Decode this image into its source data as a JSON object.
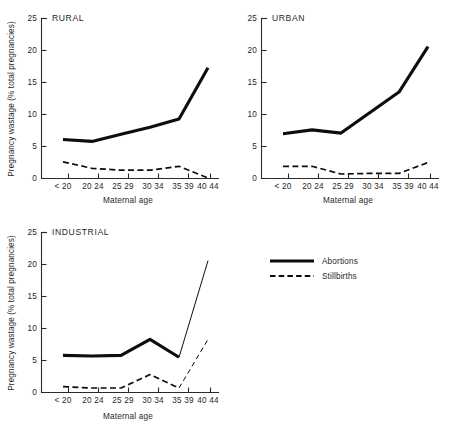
{
  "chart_data": [
    {
      "id": "rural",
      "type": "line",
      "title": "RURAL",
      "xlabel": "Maternal age",
      "ylabel": "Pregnancy wastage (% total pregnancies)",
      "categories": [
        "< 20",
        "20-24",
        "25-29",
        "30-34",
        "35-39",
        "40-44"
      ],
      "xtick_labels": [
        "< 20",
        "20 24",
        "25 29",
        "30 34",
        "35 39",
        "40 44"
      ],
      "ytick_labels": [
        "0",
        "5",
        "10",
        "15",
        "20",
        "25"
      ],
      "ytick_values": [
        0,
        5,
        10,
        15,
        20,
        25
      ],
      "ylim": [
        0,
        25
      ],
      "grid": false,
      "legend_position": "external-right",
      "series": [
        {
          "name": "Abortions",
          "style": "solid",
          "values": [
            6.1,
            5.8,
            6.9,
            8.0,
            9.3,
            17.3
          ]
        },
        {
          "name": "Stillbirths",
          "style": "dashed",
          "values": [
            2.6,
            1.6,
            1.3,
            1.3,
            1.9,
            0.1
          ]
        }
      ]
    },
    {
      "id": "urban",
      "type": "line",
      "title": "URBAN",
      "xlabel": "Maternal age",
      "ylabel": "Pregnancy wastage (% total pregnancies)",
      "categories": [
        "< 20",
        "20-24",
        "25-29",
        "30-34",
        "35-39",
        "40-44"
      ],
      "xtick_labels": [
        "< 20",
        "20 24",
        "25 29",
        "30 34",
        "35 39",
        "40 44"
      ],
      "ytick_labels": [
        "0",
        "5",
        "10",
        "15",
        "20",
        "25"
      ],
      "ytick_values": [
        0,
        5,
        10,
        15,
        20,
        25
      ],
      "ylim": [
        0,
        25
      ],
      "grid": false,
      "legend_position": "external-right",
      "series": [
        {
          "name": "Abortions",
          "style": "solid",
          "values": [
            7.0,
            7.6,
            7.1,
            10.3,
            13.5,
            20.6
          ]
        },
        {
          "name": "Stillbirths",
          "style": "dashed",
          "values": [
            1.9,
            1.9,
            0.7,
            0.8,
            0.8,
            2.5
          ]
        }
      ]
    },
    {
      "id": "industrial",
      "type": "line",
      "title": "INDUSTRIAL",
      "xlabel": "Maternal age",
      "ylabel": "Pregnancy wastage (% total pregnancies)",
      "categories": [
        "< 20",
        "20-24",
        "25-29",
        "30-34",
        "35-39",
        "40-44"
      ],
      "xtick_labels": [
        "< 20",
        "20 24",
        "25 29",
        "30 34",
        "35 39",
        "40 44"
      ],
      "ytick_labels": [
        "0",
        "5",
        "10",
        "15",
        "20",
        "25"
      ],
      "ytick_values": [
        0,
        5,
        10,
        15,
        20,
        25
      ],
      "ylim": [
        0,
        25
      ],
      "grid": false,
      "legend_position": "external-right",
      "series": [
        {
          "name": "Abortions",
          "style": "solid",
          "values": [
            5.8,
            5.7,
            5.8,
            8.3,
            5.5,
            20.6
          ],
          "thin_from_index": 4
        },
        {
          "name": "Stillbirths",
          "style": "dashed",
          "values": [
            0.9,
            0.7,
            0.7,
            2.8,
            0.7,
            8.3
          ],
          "thin_from_index": 4
        }
      ]
    }
  ],
  "legend": {
    "entries": [
      {
        "label": "Abortions",
        "style": "solid"
      },
      {
        "label": "Stillbirths",
        "style": "dashed"
      }
    ]
  }
}
